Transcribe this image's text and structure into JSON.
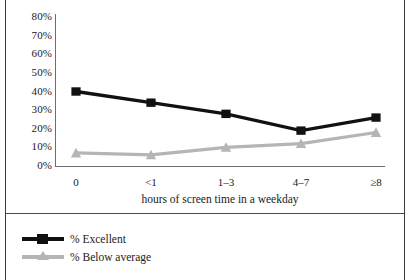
{
  "chart_data": {
    "type": "line",
    "title": "",
    "subtitle": "",
    "xlabel": "hours of screen time in a weekday",
    "ylabel": "",
    "categories": [
      "0",
      "<1",
      "1–3",
      "4–7",
      "≥8"
    ],
    "ylim": [
      0,
      80
    ],
    "ytick_labels": [
      "0%",
      "10%",
      "20%",
      "30%",
      "40%",
      "50%",
      "60%",
      "70%",
      "80%"
    ],
    "ytick_values": [
      0,
      10,
      20,
      30,
      40,
      50,
      60,
      70,
      80
    ],
    "grid": false,
    "legend_position": "bottom-left",
    "series": [
      {
        "name": "% Excellent",
        "color": "#111111",
        "marker": "square",
        "values": [
          40,
          34,
          28,
          19,
          26
        ]
      },
      {
        "name": "% Below average",
        "color": "#b5b5b5",
        "marker": "triangle",
        "values": [
          7,
          6,
          10,
          12,
          18
        ]
      }
    ]
  },
  "legend": {
    "items": [
      {
        "label": "% Excellent"
      },
      {
        "label": "% Below average"
      }
    ]
  },
  "axis": {
    "x_title": "hours of screen time in a weekday"
  }
}
